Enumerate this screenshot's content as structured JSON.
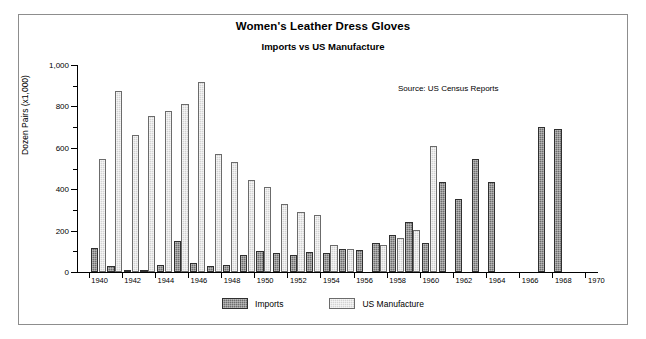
{
  "chart_data": {
    "type": "bar",
    "title": "Women's Leather Dress Gloves",
    "subtitle": "Imports vs US Manufacture",
    "annotation": "Source: US Census Reports",
    "xlabel": "",
    "ylabel": "Dozen Pairs (x1,000)",
    "ylim": [
      0,
      1000
    ],
    "ytick_values": [
      0,
      200,
      400,
      600,
      800,
      1000
    ],
    "ytick_labels": [
      "0",
      "200",
      "400",
      "600",
      "800",
      "1,000"
    ],
    "xlim": [
      1939.3,
      1970.7
    ],
    "xtick_values": [
      1940,
      1942,
      1944,
      1946,
      1948,
      1950,
      1952,
      1954,
      1956,
      1958,
      1960,
      1962,
      1964,
      1966,
      1968,
      1970
    ],
    "xtick_labels": [
      "1940",
      "1942",
      "1944",
      "1946",
      "1948",
      "1950",
      "1952",
      "1954",
      "1956",
      "1958",
      "1960",
      "1962",
      "1964",
      "1966",
      "1968",
      "1970"
    ],
    "grid": false,
    "legend_position": "bottom",
    "x": [
      1940,
      1941,
      1942,
      1943,
      1944,
      1945,
      1946,
      1947,
      1948,
      1949,
      1950,
      1951,
      1952,
      1953,
      1954,
      1955,
      1956,
      1957,
      1958,
      1959,
      1960,
      1961,
      1962,
      1963,
      1964,
      1967,
      1968
    ],
    "series": [
      {
        "name": "Imports",
        "color": "#6e6e6e",
        "values": [
          115,
          30,
          8,
          12,
          33,
          150,
          45,
          30,
          32,
          80,
          100,
          90,
          80,
          95,
          90,
          110,
          105,
          140,
          180,
          240,
          140,
          435,
          355,
          545,
          435,
          700,
          690
        ]
      },
      {
        "name": "US Manufacture",
        "color": "#d3d3d3",
        "values": [
          545,
          875,
          660,
          755,
          780,
          810,
          920,
          570,
          530,
          445,
          410,
          330,
          290,
          275,
          130,
          110,
          null,
          130,
          165,
          205,
          610,
          null,
          null,
          null,
          null,
          null,
          null
        ]
      }
    ]
  },
  "legend": {
    "items": [
      {
        "label": "Imports",
        "swatch": "imports"
      },
      {
        "label": "US Manufacture",
        "swatch": "usmfr"
      }
    ]
  }
}
